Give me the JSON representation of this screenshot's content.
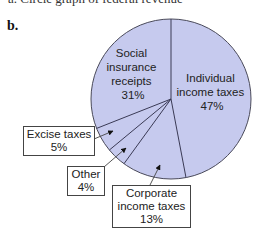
{
  "cut_text": "a. Circle graph of federal revenue",
  "panel_label": "b.",
  "colors": {
    "fill": "#c6caee",
    "stroke": "#4a4a5a"
  },
  "chart_data": {
    "type": "pie",
    "title": "",
    "start_angle_deg": 0,
    "direction": "clockwise",
    "slices": [
      {
        "label": "Individual income taxes",
        "value": 47,
        "display": "47%"
      },
      {
        "label": "Corporate income taxes",
        "value": 13,
        "display": "13%"
      },
      {
        "label": "Other",
        "value": 4,
        "display": "4%"
      },
      {
        "label": "Excise taxes",
        "value": 5,
        "display": "5%"
      },
      {
        "label": "Social insurance receipts",
        "value": 31,
        "display": "31%"
      }
    ]
  },
  "labels": {
    "social": {
      "line1": "Social",
      "line2": "insurance",
      "line3": "receipts",
      "pct": "31%"
    },
    "individual": {
      "line1": "Individual",
      "line2": "income taxes",
      "pct": "47%"
    },
    "excise": {
      "line1": "Excise taxes",
      "pct": "5%"
    },
    "other": {
      "line1": "Other",
      "pct": "4%"
    },
    "corporate": {
      "line1": "Corporate",
      "line2": "income taxes",
      "pct": "13%"
    }
  }
}
